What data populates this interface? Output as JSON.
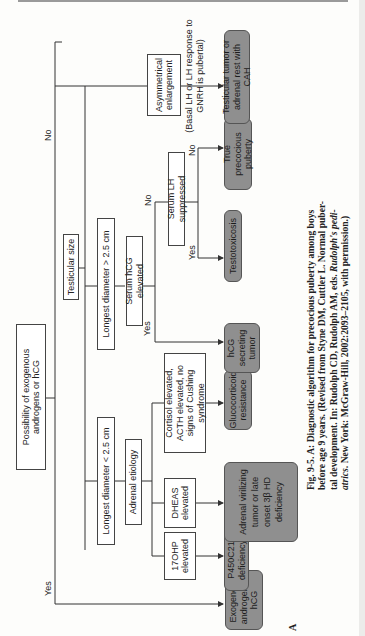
{
  "diagram": {
    "root": "Possibility of exogenous androgens or hCG",
    "root_yes_label": "Yes",
    "root_no_label": "No",
    "exogenous_outcome": "Exogenous androgen or hCG",
    "testicular_size": "Testicular size",
    "small_branch": {
      "label": "Longest diameter < 2.5 cm",
      "adrenal": "Adrenal etiology",
      "ohp": "17OHP elevated",
      "ohp_outcome": "P450C21 deficiency",
      "dheas": "DHEAS elevated",
      "dheas_outcome": "Adrenal virilizing tumor or late onset 3β HD deficiency",
      "cortisol": "Cortisol elevated, ACTH elevated, no signs of Cushing syndrome",
      "cortisol_outcome": "Glucocorticoid resistance"
    },
    "large_branch": {
      "label": "Longest diameter > 2.5 cm",
      "hcg": "Serum hCG elevated",
      "hcg_yes_label": "Yes",
      "hcg_no_label": "No",
      "hcg_outcome": "hCG secreting tumor",
      "lh": "Serum LH suppressed",
      "lh_yes_label": "Yes",
      "lh_no_label": "No",
      "lh_yes_outcome": "Testotoxicosis",
      "lh_no_note": "(Basal LH or LH response to GNRH is pubertal)",
      "lh_no_outcome": "True precocious puberty"
    },
    "asym_branch": {
      "label": "Asymmetrical enlargement",
      "outcome": "Testicular tumor or adrenal rest with CAH"
    }
  },
  "panel_label": "A",
  "caption": {
    "line1": "Fig. 9-5.   A: Diagnostic algorithm for precocious puberty among boys",
    "line2": "before age 9 years. (Revised from Styne DM, Cuttler L. Normal puber-",
    "line3_a": "tal development. In: Rudolph CD, Rudolph AM, eds. ",
    "line3_i": "Rudolph's pedi-",
    "line4_i": "atrics",
    "line4_b": ". New York: McGraw-Hill, 2002:2093–2105, with permission.)"
  },
  "colors": {
    "outcome_fill": "#8f8f8f",
    "box_border": "#444444",
    "line": "#333333"
  }
}
